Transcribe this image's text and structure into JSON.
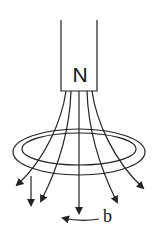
{
  "diagram": {
    "magnet_pole_label": "N",
    "direction_label": "b",
    "colors": {
      "line": "#222222",
      "background": "#ffffff"
    }
  }
}
